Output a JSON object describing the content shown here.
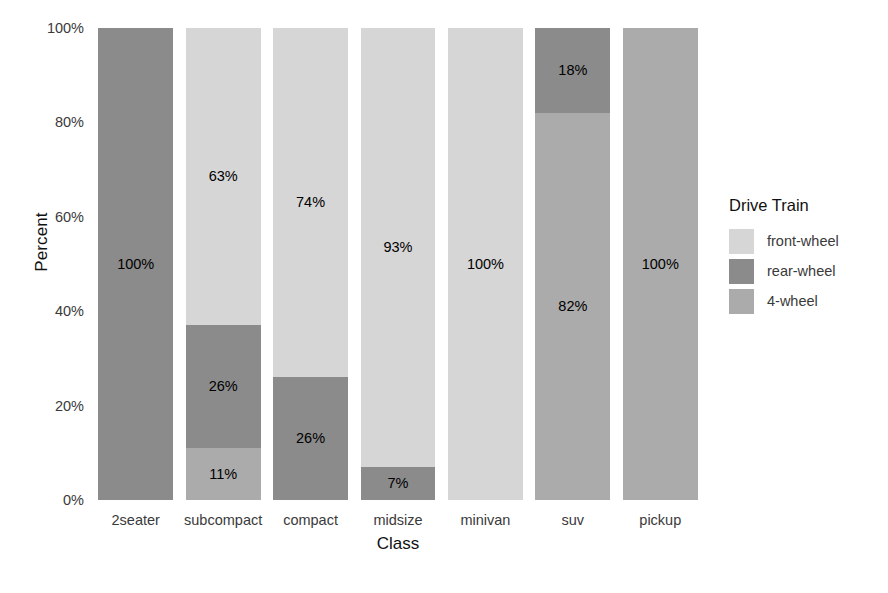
{
  "chart_data": {
    "type": "bar",
    "stacked": true,
    "normalized_percent": true,
    "title": "",
    "xlabel": "Class",
    "ylabel": "Percent",
    "ylim": [
      0,
      100
    ],
    "ytick_labels": [
      "0%",
      "20%",
      "40%",
      "60%",
      "80%",
      "100%"
    ],
    "ytick_values": [
      0,
      20,
      40,
      60,
      80,
      100
    ],
    "grid": false,
    "legend_title": "Drive Train",
    "legend_position": "right",
    "categories": [
      "2seater",
      "subcompact",
      "compact",
      "midsize",
      "minivan",
      "suv",
      "pickup"
    ],
    "series": [
      {
        "name": "front-wheel",
        "color": "#d6d6d6",
        "values": [
          0,
          63,
          74,
          93,
          100,
          0,
          0
        ],
        "labels": [
          "",
          "63%",
          "74%",
          "93%",
          "100%",
          "",
          ""
        ]
      },
      {
        "name": "rear-wheel",
        "color": "#8b8b8b",
        "values": [
          100,
          26,
          26,
          7,
          0,
          18,
          0
        ],
        "labels": [
          "100%",
          "26%",
          "26%",
          "7%",
          "",
          "18%",
          ""
        ]
      },
      {
        "name": "4-wheel",
        "color": "#ababab",
        "values": [
          0,
          11,
          0,
          0,
          0,
          82,
          100
        ],
        "labels": [
          "",
          "11%",
          "",
          "",
          "",
          "82%",
          "100%"
        ]
      }
    ]
  },
  "axes": {
    "y_title": "Percent",
    "x_title": "Class",
    "y_ticks": [
      "0%",
      "20%",
      "40%",
      "60%",
      "80%",
      "100%"
    ],
    "x_ticks": [
      "2seater",
      "subcompact",
      "compact",
      "midsize",
      "minivan",
      "suv",
      "pickup"
    ]
  },
  "legend": {
    "title": "Drive Train",
    "items": [
      {
        "label": "front-wheel",
        "color": "#d6d6d6"
      },
      {
        "label": "rear-wheel",
        "color": "#8b8b8b"
      },
      {
        "label": "4-wheel",
        "color": "#ababab"
      }
    ]
  }
}
